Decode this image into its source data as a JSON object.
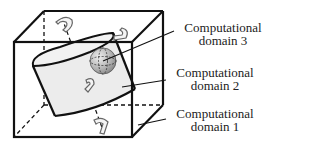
{
  "figure": {
    "labels": [
      {
        "line1": "Computational",
        "line2": "domain 3"
      },
      {
        "line1": "Computational",
        "line2": "domain 2"
      },
      {
        "line1": "Computational",
        "line2": "domain 1"
      }
    ],
    "colors": {
      "stroke": "#111111",
      "cylinder_fill": "#ececec",
      "sphere_light": "#e6e6e6",
      "sphere_dark": "#8a8a8a",
      "text": "#222222"
    }
  }
}
